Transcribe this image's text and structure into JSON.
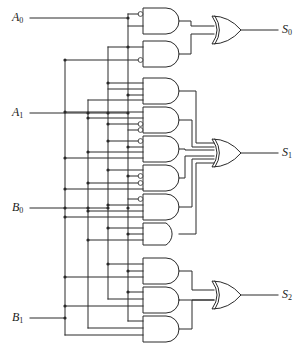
{
  "figure": {
    "caption": ""
  },
  "inputs": [
    {
      "id": "A0",
      "base": "A",
      "sub": "0",
      "label": "A0",
      "y": 18,
      "label_x": 12,
      "label_y": 11
    },
    {
      "id": "A1",
      "base": "A",
      "sub": "1",
      "label": "A1",
      "y": 113,
      "label_x": 12,
      "label_y": 106
    },
    {
      "id": "B0",
      "base": "B",
      "sub": "0",
      "label": "B0",
      "y": 208,
      "label_x": 12,
      "label_y": 201
    },
    {
      "id": "B1",
      "base": "B",
      "sub": "1",
      "label": "B1",
      "y": 318,
      "label_x": 12,
      "label_y": 311
    }
  ],
  "outputs": [
    {
      "id": "S0",
      "base": "S",
      "sub": "0",
      "label": "S0",
      "y": 30,
      "label_x": 282,
      "label_y": 23
    },
    {
      "id": "S1",
      "base": "S",
      "sub": "1",
      "label": "S1",
      "y": 153,
      "label_x": 282,
      "label_y": 146
    },
    {
      "id": "S2",
      "base": "S",
      "sub": "2",
      "label": "S2",
      "y": 295,
      "label_x": 282,
      "label_y": 288
    }
  ],
  "blocks": [
    {
      "name": "s0-block",
      "output": "S0",
      "and_gate_count": 2,
      "or_gate_count": 1
    },
    {
      "name": "s1-block",
      "output": "S1",
      "and_gate_count": 6,
      "or_gate_count": 1
    },
    {
      "name": "s2-block",
      "output": "S2",
      "and_gate_count": 3,
      "or_gate_count": 1
    }
  ],
  "gate_counts": {
    "and_total": 11,
    "or_total": 3,
    "inverter_bubbles": 14
  },
  "bus_lines_x": [
    65,
    88,
    108,
    128
  ],
  "colors": {
    "wire": "#2a2a2a",
    "gate_fill": "#ffffff",
    "background": "#ffffff",
    "text": "#1a1a1a"
  }
}
